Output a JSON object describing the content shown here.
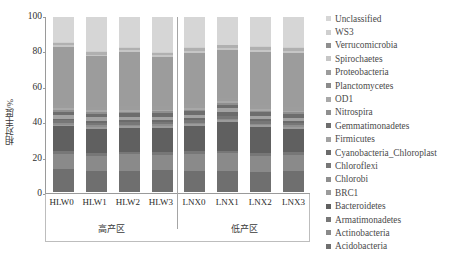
{
  "chart_data": {
    "type": "bar",
    "subtype": "stacked-100-percent",
    "title": "",
    "xlabel": "",
    "ylabel": "相对丰度/%",
    "ylim": [
      0,
      100
    ],
    "yticks": [
      0,
      20,
      40,
      60,
      80,
      100
    ],
    "grid": false,
    "legend_position": "right",
    "categories": [
      "HLW0",
      "HLW1",
      "HLW2",
      "HLW3",
      "LNX0",
      "LNX1",
      "LNX2",
      "LNX3"
    ],
    "groups": [
      {
        "label": "高产区",
        "categories": [
          "HLW0",
          "HLW1",
          "HLW2",
          "HLW3"
        ]
      },
      {
        "label": "低产区",
        "categories": [
          "LNX0",
          "LNX1",
          "LNX2",
          "LNX3"
        ]
      }
    ],
    "series": [
      {
        "name": "Acidobacteria",
        "color": "#6f6f6f",
        "values": [
          13.0,
          12.5,
          12.0,
          12.5,
          12.0,
          12.0,
          11.5,
          12.0
        ]
      },
      {
        "name": "Actinobacteria",
        "color": "#8a8a8a",
        "values": [
          9.0,
          8.5,
          9.5,
          9.0,
          10.0,
          10.5,
          9.5,
          9.5
        ]
      },
      {
        "name": "Armatimonadetes",
        "color": "#777777",
        "values": [
          1.5,
          1.5,
          1.5,
          1.5,
          1.5,
          1.5,
          1.5,
          1.5
        ]
      },
      {
        "name": "Bacteroidetes",
        "color": "#606060",
        "values": [
          14.0,
          14.5,
          13.5,
          14.0,
          14.5,
          16.5,
          15.0,
          13.5
        ]
      },
      {
        "name": "BRC1",
        "color": "#9b9b9b",
        "values": [
          1.0,
          1.0,
          1.0,
          1.0,
          1.0,
          1.0,
          1.0,
          1.0
        ]
      },
      {
        "name": "Chlorobi",
        "color": "#8e8e8e",
        "values": [
          1.0,
          1.0,
          1.0,
          1.0,
          1.0,
          1.0,
          1.0,
          1.0
        ]
      },
      {
        "name": "Chloroflexi",
        "color": "#777777",
        "values": [
          1.5,
          1.5,
          1.5,
          1.5,
          1.5,
          1.5,
          1.5,
          1.5
        ]
      },
      {
        "name": "Cyanobacteria_Chloroplast",
        "color": "#6b6b6b",
        "values": [
          1.0,
          1.0,
          1.0,
          1.0,
          1.0,
          2.5,
          1.0,
          1.0
        ]
      },
      {
        "name": "Firmicutes",
        "color": "#a2a2a2",
        "values": [
          2.0,
          2.0,
          2.0,
          2.0,
          2.0,
          2.0,
          2.0,
          2.0
        ]
      },
      {
        "name": "Gemmatimonadetes",
        "color": "#6d6d6d",
        "values": [
          2.0,
          2.0,
          2.0,
          2.0,
          2.0,
          2.0,
          2.0,
          2.0
        ]
      },
      {
        "name": "Nitrospira",
        "color": "#8f8f8f",
        "values": [
          1.0,
          1.0,
          1.0,
          1.0,
          1.0,
          1.0,
          1.0,
          1.0
        ]
      },
      {
        "name": "OD1",
        "color": "#a8a8a8",
        "values": [
          1.0,
          1.0,
          1.0,
          1.0,
          1.0,
          1.0,
          1.0,
          1.0
        ]
      },
      {
        "name": "Planctomycetes",
        "color": "#9d9d9d",
        "values": [
          2.0,
          2.0,
          2.0,
          2.0,
          2.0,
          2.0,
          2.0,
          2.0
        ]
      },
      {
        "name": "Proteobacteria",
        "color": "#9c9c9c",
        "values": [
          33.0,
          29.5,
          31.0,
          28.5,
          30.0,
          28.0,
          31.0,
          31.5
        ]
      },
      {
        "name": "Spirochaetes",
        "color": "#c6c6c6",
        "values": [
          1.0,
          1.0,
          1.0,
          1.0,
          1.0,
          1.0,
          1.0,
          1.0
        ]
      },
      {
        "name": "Verrucomicrobia",
        "color": "#b0b0b0",
        "values": [
          1.0,
          1.5,
          1.5,
          1.5,
          1.5,
          1.5,
          1.5,
          1.5
        ]
      },
      {
        "name": "WS3",
        "color": "#cfcfcf",
        "values": [
          0.5,
          0.5,
          0.5,
          0.5,
          0.5,
          0.5,
          0.5,
          0.5
        ]
      },
      {
        "name": "Unclassified",
        "color": "#d6d6d6",
        "values": [
          14.5,
          20.0,
          17.0,
          20.0,
          17.5,
          16.0,
          17.0,
          17.5
        ]
      }
    ]
  },
  "legend": {
    "items": [
      {
        "label": "Unclassified",
        "color": "#d6d6d6"
      },
      {
        "label": "WS3",
        "color": "#cfcfcf"
      },
      {
        "label": "Verrucomicrobia",
        "color": "#8f8f8f"
      },
      {
        "label": "Spirochaetes",
        "color": "#c6c6c6"
      },
      {
        "label": "Proteobacteria",
        "color": "#9c9c9c"
      },
      {
        "label": "Planctomycetes",
        "color": "#8b8b8b"
      },
      {
        "label": "OD1",
        "color": "#a8a8a8"
      },
      {
        "label": "Nitrospira",
        "color": "#8f8f8f"
      },
      {
        "label": "Gemmatimonadetes",
        "color": "#6d6d6d"
      },
      {
        "label": "Firmicutes",
        "color": "#a2a2a2"
      },
      {
        "label": "Cyanobacteria_Chloroplast",
        "color": "#6b6b6b"
      },
      {
        "label": "Chloroflexi",
        "color": "#777777"
      },
      {
        "label": "Chlorobi",
        "color": "#8e8e8e"
      },
      {
        "label": "BRC1",
        "color": "#9b9b9b"
      },
      {
        "label": "Bacteroidetes",
        "color": "#606060"
      },
      {
        "label": "Armatimonadetes",
        "color": "#777777"
      },
      {
        "label": "Actinobacteria",
        "color": "#8a8a8a"
      },
      {
        "label": "Acidobacteria",
        "color": "#6f6f6f"
      }
    ]
  }
}
